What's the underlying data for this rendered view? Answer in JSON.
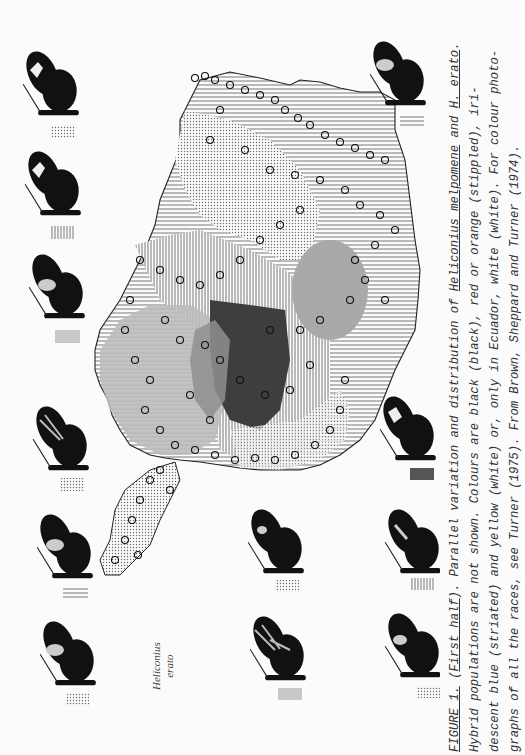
{
  "figure": {
    "orientation": "rotated 90° counter-clockwise (landscape figure on portrait page)",
    "species_label_line1": "Heliconius",
    "species_label_line2": "erato",
    "caption": {
      "line1_parts": [
        {
          "text": "FIGURE 1.",
          "style": "italic underline"
        },
        {
          "text": " (",
          "style": "italic"
        },
        {
          "text": "First half",
          "style": "italic underline"
        },
        {
          "text": "). Parallel variation and distribution of ",
          "style": "italic"
        },
        {
          "text": "Heliconius melpomene",
          "style": "italic underline"
        },
        {
          "text": " and ",
          "style": "italic"
        },
        {
          "text": "H. erato",
          "style": "italic underline"
        },
        {
          "text": ".",
          "style": "italic"
        }
      ],
      "line2": "Hybrid populations are not shown.  Colours are black (black), red or orange (stippled), iri-",
      "line2_underlined_prefix": "Hybrid",
      "line3": "descent blue (striated) and yellow (white) or, only in Ecuador, white (white).  For colour photo-",
      "line4": "graphs of all the races, see Turner (1975). From Brown, Sheppard and Turner (1974)."
    },
    "legend_patterns": {
      "black": "black",
      "red_or_orange": "stippled",
      "iridescent_blue": "striated",
      "yellow": "white",
      "white_ecuador": "white"
    },
    "butterflies": [
      {
        "id": 1,
        "position": "top-left-1",
        "swatch": "dots"
      },
      {
        "id": 2,
        "position": "top-left-2",
        "swatch": "vertical-lines"
      },
      {
        "id": 3,
        "position": "top-left-3",
        "swatch": "light-gray"
      },
      {
        "id": 4,
        "position": "left-4",
        "swatch": "dots"
      },
      {
        "id": 5,
        "position": "left-5",
        "swatch": "horizontal-lines"
      },
      {
        "id": 6,
        "position": "left-6",
        "swatch": "dots"
      },
      {
        "id": 7,
        "position": "bottom-1",
        "swatch": "light-gray"
      },
      {
        "id": 8,
        "position": "bottom-2",
        "swatch": "speckle"
      },
      {
        "id": 9,
        "position": "bottom-3",
        "swatch": "dots"
      },
      {
        "id": 10,
        "position": "bottom-4",
        "swatch": "vertical-lines"
      },
      {
        "id": 11,
        "position": "right-middle",
        "swatch": "dark-gray"
      },
      {
        "id": 12,
        "position": "top-right",
        "swatch": "horizontal-lines"
      }
    ],
    "colors": {
      "ink": "#111111",
      "paper": "#fbfbfb",
      "gray_light": "#c8c8c8",
      "gray_mid": "#a8a8a8",
      "gray_dark": "#444444"
    }
  }
}
